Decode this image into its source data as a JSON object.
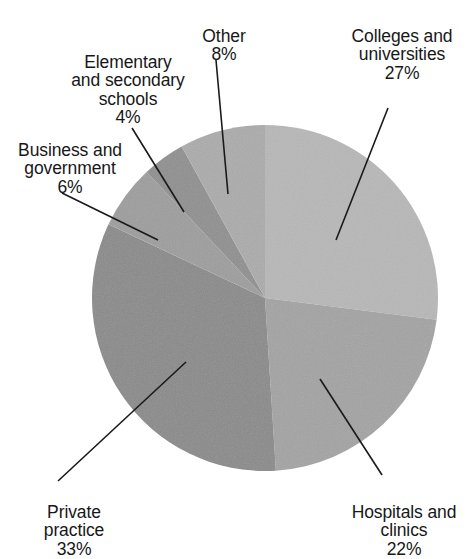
{
  "chart_data": {
    "type": "pie",
    "title": "",
    "subtitle": "",
    "xlabel": "",
    "ylabel": "",
    "legend_position": "none",
    "grid": false,
    "units": "percent",
    "total": 100,
    "start_angle_deg": 0,
    "direction": "clockwise",
    "categories": [
      "Colleges and universities",
      "Hospitals and clinics",
      "Private practice",
      "Business and government",
      "Elementary and secondary schools",
      "Other"
    ],
    "values": [
      27,
      22,
      33,
      6,
      4,
      8
    ],
    "slices": [
      {
        "label": "Colleges and universities",
        "value": 27,
        "pct_text": "27%",
        "color": "#b7b7b7",
        "start_deg": 0,
        "end_deg": 97.2
      },
      {
        "label": "Hospitals and clinics",
        "value": 22,
        "pct_text": "22%",
        "color": "#a3a3a3",
        "start_deg": 97.2,
        "end_deg": 176.4
      },
      {
        "label": "Private practice",
        "value": 33,
        "pct_text": "33%",
        "color": "#8a8a8a",
        "start_deg": 176.4,
        "end_deg": 295.2
      },
      {
        "label": "Business and government",
        "value": 6,
        "pct_text": "6%",
        "color": "#9d9d9d",
        "start_deg": 295.2,
        "end_deg": 316.8
      },
      {
        "label": "Elementary and secondary schools",
        "value": 4,
        "pct_text": "4%",
        "color": "#8f8f8f",
        "start_deg": 316.8,
        "end_deg": 331.2
      },
      {
        "label": "Other",
        "value": 8,
        "pct_text": "8%",
        "color": "#ababab",
        "start_deg": 331.2,
        "end_deg": 360
      }
    ]
  },
  "labels": {
    "colleges": {
      "name": "Colleges and\nuniversities",
      "pct": "27%"
    },
    "other": {
      "name": "Other",
      "pct": "8%"
    },
    "elementary": {
      "name": "Elementary\nand secondary\nschools",
      "pct": "4%"
    },
    "business": {
      "name": "Business and\ngovernment",
      "pct": "6%"
    },
    "private": {
      "name": "Private\npractice",
      "pct": "33%"
    },
    "hospitals": {
      "name": "Hospitals and\nclinics",
      "pct": "22%"
    }
  },
  "style": {
    "background": "#ffffff",
    "text_color": "#171717",
    "leader_line_color": "#1a1a1a"
  }
}
